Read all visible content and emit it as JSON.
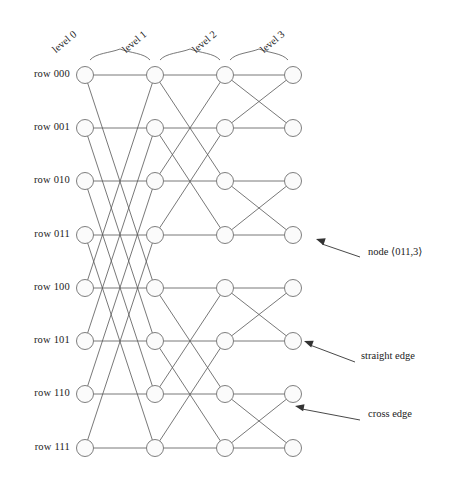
{
  "figure": {
    "kind": "butterfly-network-diagram",
    "rows": 8,
    "levels": 4,
    "node_radius": 8.5,
    "colors": {
      "edge": "#555555",
      "node_stroke": "#6f6f6f",
      "node_fill": "#fbfbfb",
      "text": "#222222",
      "annotation_line": "#333333"
    }
  },
  "row_labels": [
    {
      "text": "row 000",
      "bits": "000",
      "y": 75
    },
    {
      "text": "row 001",
      "bits": "001",
      "y": 128
    },
    {
      "text": "row 010",
      "bits": "010",
      "y": 181
    },
    {
      "text": "row 011",
      "bits": "011",
      "y": 235
    },
    {
      "text": "row 100",
      "bits": "100",
      "y": 288
    },
    {
      "text": "row 101",
      "bits": "101",
      "y": 341
    },
    {
      "text": "row 110",
      "bits": "110",
      "y": 394
    },
    {
      "text": "row 111",
      "bits": "111",
      "y": 448
    }
  ],
  "level_labels": [
    {
      "text": "level 0",
      "x": 85
    },
    {
      "text": "level 1",
      "x": 155
    },
    {
      "text": "level 2",
      "x": 225
    },
    {
      "text": "level 3",
      "x": 293
    }
  ],
  "columns_x": [
    85,
    155,
    225,
    293
  ],
  "braces": [
    {
      "x1": 90,
      "x2": 150,
      "label": "level 1"
    },
    {
      "x1": 160,
      "x2": 220,
      "label": "level 2"
    },
    {
      "x1": 230,
      "x2": 288,
      "label": "level 3"
    }
  ],
  "edges": {
    "straight_description": "horizontal edges connect same row across consecutive levels",
    "cross_stages": [
      {
        "from_level": 0,
        "to_level": 1,
        "flipped_bit": 0,
        "row_distance": 4
      },
      {
        "from_level": 1,
        "to_level": 2,
        "flipped_bit": 1,
        "row_distance": 2
      },
      {
        "from_level": 2,
        "to_level": 3,
        "flipped_bit": 2,
        "row_distance": 1
      }
    ]
  },
  "annotations": [
    {
      "id": "node-annotation",
      "text": "node ⟨011,3⟩",
      "label_x": 368,
      "label_y": 252,
      "line": {
        "x1": 360,
        "y1": 257,
        "x2": 322,
        "y2": 244
      },
      "arrow": {
        "x": 316,
        "y": 239,
        "angle": 198
      }
    },
    {
      "id": "straight-edge-annotation",
      "text": "straight edge",
      "label_x": 361,
      "label_y": 357,
      "line": {
        "x1": 355,
        "y1": 362,
        "x2": 310,
        "y2": 345
      },
      "arrow": {
        "x": 304,
        "y": 341,
        "angle": 200
      }
    },
    {
      "id": "cross-edge-annotation",
      "text": "cross edge",
      "label_x": 368,
      "label_y": 415,
      "line": {
        "x1": 360,
        "y1": 420,
        "x2": 302,
        "y2": 409
      },
      "arrow": {
        "x": 295,
        "y": 406,
        "angle": 191
      }
    }
  ]
}
